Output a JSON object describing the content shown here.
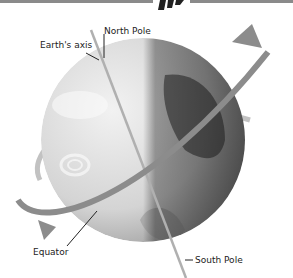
{
  "diagram": {
    "type": "earth-rotation-illustration",
    "labels": {
      "north_pole": "North Pole",
      "earths_axis": "Earth's axis",
      "equator": "Equator",
      "south_pole": "South Pole"
    },
    "colors": {
      "globe_light": "#e6e6e6",
      "globe_dark": "#5a5a5a",
      "arrow": "#8c8c8c",
      "axis": "#b0b0b0",
      "leader_line": "#222222",
      "top_bar": "#8a8a8a"
    }
  }
}
